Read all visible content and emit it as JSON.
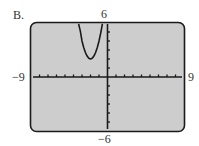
{
  "figure": {
    "label": "B.",
    "window": {
      "xmin_label": "−9",
      "xmax_label": "9",
      "ymin_label": "−6",
      "ymax_label": "6"
    },
    "colors": {
      "screen_background": "#cdcdcd",
      "screen_border": "#1a1a1a",
      "curve": "#1a1a1a",
      "axes": "#1a1a1a"
    }
  },
  "chart_data": {
    "type": "line",
    "title": "B.",
    "xlabel": "",
    "ylabel": "",
    "xlim": [
      -9,
      9
    ],
    "ylim": [
      -6,
      6
    ],
    "x_ticks_step": 1,
    "y_ticks_step": 1,
    "grid": false,
    "legend": null,
    "tick_labels": {
      "x": [
        "−9",
        "9"
      ],
      "y": [
        "−6",
        "6"
      ]
    },
    "series": [
      {
        "name": "parabola (graphing calculator display)",
        "description": "Upward-opening parabola with vertex near (-2, 2), clipped at top of window",
        "x": [
          -3.4,
          -3.2,
          -3.0,
          -2.8,
          -2.6,
          -2.4,
          -2.2,
          -2.0,
          -1.8,
          -1.6,
          -1.4,
          -1.2,
          -1.0,
          -0.8,
          -0.6
        ],
        "y": [
          5.92,
          5.12,
          4.0,
          3.28,
          2.72,
          2.32,
          2.08,
          2.0,
          2.08,
          2.32,
          2.72,
          3.28,
          4.0,
          4.88,
          5.92
        ]
      }
    ]
  }
}
